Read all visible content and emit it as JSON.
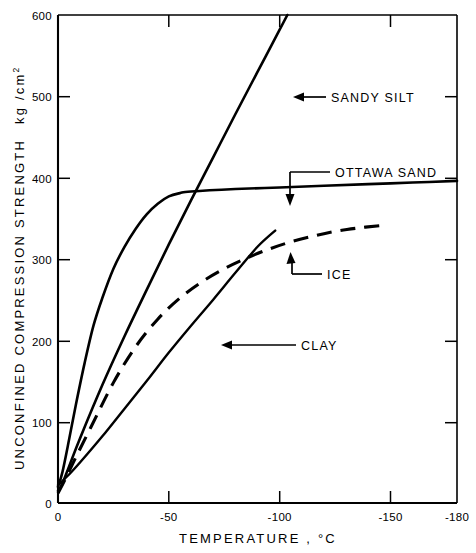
{
  "chart_data": {
    "type": "line",
    "title": "",
    "xlabel": "TEMPERATURE ,  °C",
    "ylabel": "UNCONFINED COMPRESSION STRENGTH",
    "ylabel_units": "kg /cm",
    "ylabel_units_sup": "2",
    "xlim": [
      0,
      -180
    ],
    "ylim": [
      0,
      600
    ],
    "grid": false,
    "legend_position": "inline-annotations",
    "xticks": [
      0,
      -50,
      -100,
      -150,
      -180
    ],
    "xtick_labels": [
      "0",
      "-50",
      "-100",
      "-150",
      "-180"
    ],
    "yticks": [
      0,
      100,
      200,
      300,
      400,
      500,
      600
    ],
    "ytick_labels": [
      "0",
      "100",
      "200",
      "300",
      "400",
      "500",
      "600"
    ],
    "series": [
      {
        "name": "SANDY SILT",
        "style": "solid",
        "label": "SANDY SILT",
        "x": [
          0,
          -2,
          -5,
          -10,
          -20,
          -30,
          -40,
          -50,
          -60,
          -70,
          -80,
          -90,
          -100,
          -110,
          -120
        ],
        "y": [
          15,
          24,
          45,
          80,
          145,
          205,
          262,
          318,
          372,
          425,
          478,
          530,
          582,
          634,
          686
        ]
      },
      {
        "name": "OTTAWA SAND",
        "style": "solid",
        "label": "OTTAWA SAND",
        "x": [
          0,
          -2,
          -5,
          -8,
          -12,
          -16,
          -20,
          -25,
          -30,
          -35,
          -40,
          -45,
          -50,
          -55,
          -60,
          -80,
          -100,
          -120,
          -140,
          -160,
          -180
        ],
        "y": [
          20,
          38,
          78,
          120,
          172,
          218,
          252,
          288,
          315,
          337,
          355,
          368,
          377,
          381,
          383,
          386,
          388,
          390,
          392,
          394,
          396
        ]
      },
      {
        "name": "ICE",
        "style": "dashed",
        "label": "ICE",
        "x": [
          0,
          -3,
          -8,
          -15,
          -25,
          -35,
          -45,
          -55,
          -65,
          -75,
          -85,
          -95,
          -105,
          -115,
          -125,
          -135,
          -145
        ],
        "y": [
          12,
          28,
          56,
          94,
          148,
          192,
          226,
          252,
          272,
          288,
          301,
          312,
          321,
          328,
          334,
          338,
          341
        ]
      },
      {
        "name": "CLAY",
        "style": "solid",
        "label": "CLAY",
        "x": [
          0,
          -5,
          -10,
          -20,
          -30,
          -40,
          -50,
          -60,
          -70,
          -80,
          -90,
          -98
        ],
        "y": [
          22,
          35,
          50,
          82,
          116,
          150,
          185,
          218,
          250,
          283,
          315,
          335
        ]
      }
    ],
    "annotations": [
      {
        "text": "SANDY SILT",
        "arrow": "left",
        "target_x": -78,
        "target_y": 502
      },
      {
        "text": "OTTAWA SAND",
        "arrow": "down",
        "target_x": -64,
        "target_y": 384
      },
      {
        "text": "ICE",
        "arrow": "up-left",
        "target_x": -93,
        "target_y": 316
      },
      {
        "text": "CLAY",
        "arrow": "left",
        "target_x": -60,
        "target_y": 216
      }
    ]
  },
  "colors": {
    "axis": "#000000",
    "curve": "#000000",
    "background": "#ffffff"
  }
}
